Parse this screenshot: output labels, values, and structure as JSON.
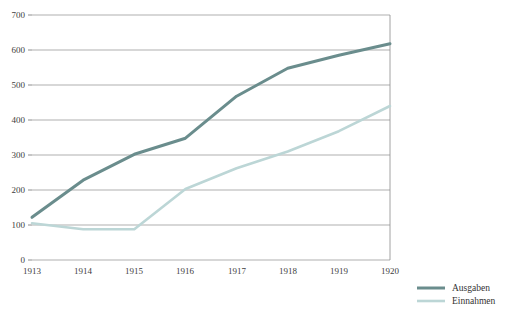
{
  "chart_data": {
    "type": "line",
    "title": "",
    "xlabel": "",
    "ylabel": "",
    "categories": [
      "1913",
      "1914",
      "1915",
      "1916",
      "1917",
      "1918",
      "1919",
      "1920"
    ],
    "x": [
      1913,
      1914,
      1915,
      1916,
      1917,
      1918,
      1919,
      1920
    ],
    "xlim": [
      1913,
      1920
    ],
    "ylim": [
      0,
      700
    ],
    "y_ticks": [
      0,
      100,
      200,
      300,
      400,
      500,
      600,
      700
    ],
    "y_tick_labels": [
      "0",
      "100",
      "200",
      "300",
      "400",
      "500",
      "600",
      "700"
    ],
    "grid": true,
    "legend_position": "bottom-right",
    "series": [
      {
        "name": "Ausgaben",
        "color": "#6a8d8d",
        "values": [
          122,
          228,
          302,
          348,
          468,
          548,
          585,
          618
        ]
      },
      {
        "name": "Einnahmen",
        "color": "#bcd6d6",
        "values": [
          105,
          88,
          88,
          203,
          262,
          310,
          368,
          440
        ]
      }
    ]
  },
  "axes": {
    "y_labels": [
      "700",
      "600",
      "500",
      "400",
      "300",
      "200",
      "100",
      "0"
    ],
    "x_labels": [
      "1913",
      "1914",
      "1915",
      "1916",
      "1917",
      "1918",
      "1919",
      "1920"
    ]
  },
  "legend": {
    "items": [
      {
        "label": "Ausgaben",
        "color": "#6a8d8d"
      },
      {
        "label": "Einnahmen",
        "color": "#bcd6d6"
      }
    ]
  },
  "colors": {
    "series_dark": "#6a8d8d",
    "series_light": "#bcd6d6",
    "grid": "#8c8c8c",
    "text": "#3a3a3a",
    "background": "#ffffff"
  }
}
